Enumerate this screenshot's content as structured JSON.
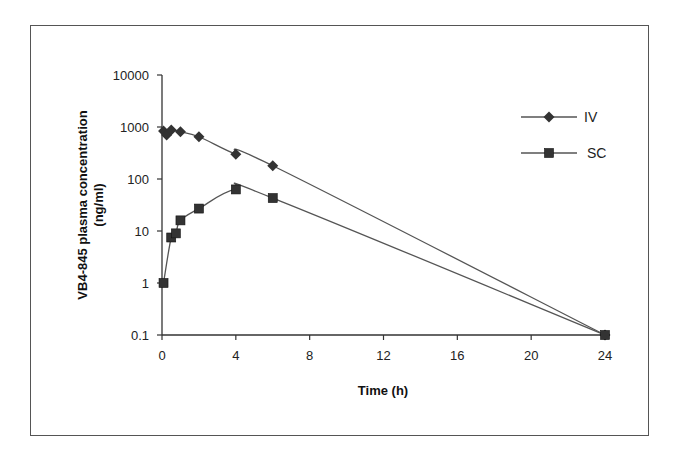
{
  "chart_data": {
    "type": "line",
    "title": "",
    "xlabel": "Time (h)",
    "ylabel": "VB4-845 plasma concentration",
    "ylabel_units": "(ng/ml)",
    "yscale": "log",
    "xlim": [
      0,
      24
    ],
    "ylim": [
      0.1,
      10000
    ],
    "x_ticks": [
      0,
      4,
      8,
      12,
      16,
      20,
      24
    ],
    "y_ticks": [
      0.1,
      1,
      10,
      100,
      1000,
      10000
    ],
    "y_tick_labels": [
      "0.1",
      "1",
      "10",
      "100",
      "1000",
      "10000"
    ],
    "grid": false,
    "legend_position": "upper right",
    "series": [
      {
        "name": "IV",
        "marker": "diamond",
        "color": "#333333",
        "x": [
          0.083,
          0.25,
          0.5,
          1,
          2,
          4,
          6,
          24
        ],
        "values": [
          840,
          700,
          880,
          810,
          650,
          300,
          180,
          0.1
        ]
      },
      {
        "name": "SC",
        "marker": "square",
        "color": "#333333",
        "x": [
          0.083,
          0.5,
          0.75,
          1,
          2,
          4,
          6,
          24
        ],
        "values": [
          1,
          7.5,
          9,
          16,
          27,
          63,
          43,
          0.1
        ]
      }
    ]
  }
}
